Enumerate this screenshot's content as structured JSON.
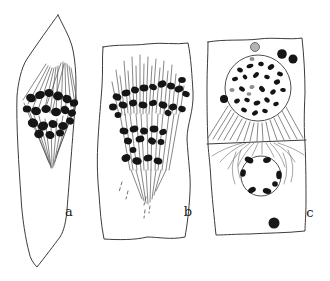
{
  "figure": {
    "panel_labels": {
      "a": "a",
      "b": "b",
      "c": "c"
    },
    "colors": {
      "background": "#ffffff",
      "ink": "#3c3c3c",
      "chromatin": "#151515",
      "gray_body": "#b3b3b3"
    }
  }
}
